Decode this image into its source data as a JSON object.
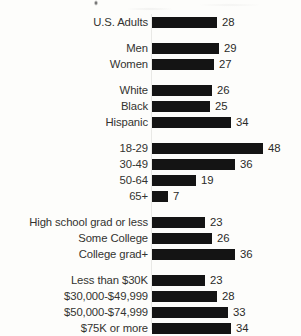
{
  "chart_data": {
    "type": "bar",
    "orientation": "horizontal",
    "title": "",
    "xlabel": "",
    "ylabel": "",
    "xlim": [
      0,
      48
    ],
    "grid": false,
    "legend": null,
    "value_labels": true,
    "bar_color": "#141414",
    "groups": [
      {
        "name": "total",
        "categories": [
          "U.S. Adults"
        ],
        "values": [
          28
        ]
      },
      {
        "name": "gender",
        "categories": [
          "Men",
          "Women"
        ],
        "values": [
          29,
          27
        ]
      },
      {
        "name": "race-ethnicity",
        "categories": [
          "White",
          "Black",
          "Hispanic"
        ],
        "values": [
          26,
          25,
          34
        ]
      },
      {
        "name": "age",
        "categories": [
          "18-29",
          "30-49",
          "50-64",
          "65+"
        ],
        "values": [
          48,
          36,
          19,
          7
        ]
      },
      {
        "name": "education",
        "categories": [
          "High school grad or less",
          "Some College",
          "College grad+"
        ],
        "values": [
          23,
          26,
          36
        ]
      },
      {
        "name": "income",
        "categories": [
          "Less than $30K",
          "$30,000-$49,999",
          "$50,000-$74,999",
          "$75K or more"
        ],
        "values": [
          23,
          28,
          33,
          34
        ]
      }
    ],
    "categories": [
      "U.S. Adults",
      "Men",
      "Women",
      "White",
      "Black",
      "Hispanic",
      "18-29",
      "30-49",
      "50-64",
      "65+",
      "High school grad or less",
      "Some College",
      "College grad+",
      "Less than $30K",
      "$30,000-$49,999",
      "$50,000-$74,999",
      "$75K or more"
    ],
    "values": [
      28,
      29,
      27,
      26,
      25,
      34,
      48,
      36,
      19,
      7,
      23,
      26,
      36,
      23,
      28,
      33,
      34
    ]
  }
}
